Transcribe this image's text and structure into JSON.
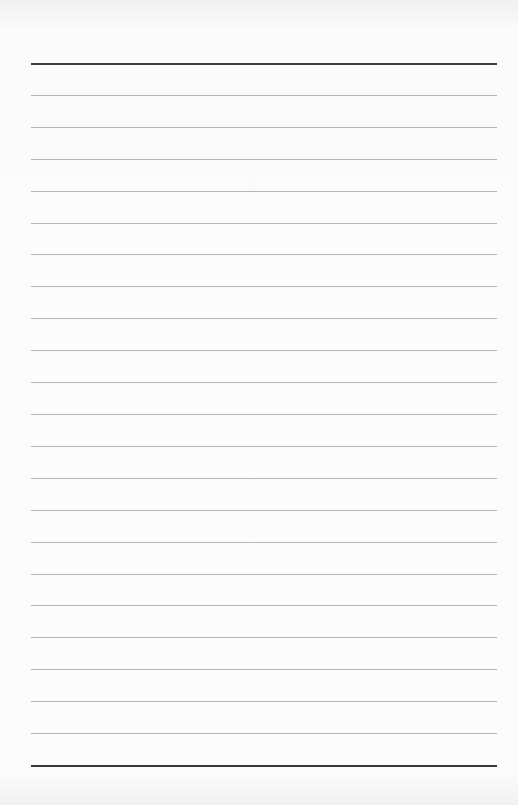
{
  "document": {
    "type": "lined-paper",
    "top_rule_y": 63,
    "bottom_rule_y": 765,
    "line_count_total": 23,
    "rule_color": "#b5b5b5",
    "heavy_rule_color": "#3a3a3a"
  }
}
